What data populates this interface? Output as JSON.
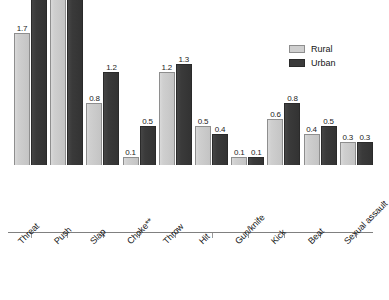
{
  "chart_data": {
    "type": "bar",
    "title": "",
    "subtitle": "",
    "xlabel": "",
    "ylabel": "",
    "ylim": [
      0,
      3.0
    ],
    "grid": false,
    "legend_position": "top-right",
    "categories": [
      "Threat",
      "Push",
      "Slap",
      "Choke**",
      "Throw",
      "Hit",
      "Gun/knife",
      "Kick",
      "Beat",
      "Sexual assault"
    ],
    "series": [
      {
        "name": "Rural",
        "color": "#cfcfcf",
        "values": [
          1.7,
          2.7,
          0.8,
          0.1,
          1.2,
          0.5,
          0.1,
          0.6,
          0.4,
          0.3
        ],
        "labels": [
          "1.7",
          "2.7",
          "0.8",
          "0.1",
          "1.2",
          "0.5",
          "0.1",
          "0.6",
          "0.4",
          "0.3"
        ]
      },
      {
        "name": "Urban",
        "color": "#3a3a3a",
        "values": [
          2.2,
          2.7,
          1.2,
          0.5,
          1.3,
          0.4,
          0.1,
          0.8,
          0.5,
          0.3
        ],
        "labels": [
          "2.2",
          "2.7",
          "1.2",
          "0.5",
          "1.3",
          "0.4",
          "0.1",
          "0.8",
          "0.5",
          "0.3"
        ]
      }
    ],
    "annotations": [
      "**"
    ]
  },
  "legend": {
    "items": [
      {
        "label": "Rural",
        "swatch": "rural"
      },
      {
        "label": "Urban",
        "swatch": "urban"
      }
    ]
  }
}
